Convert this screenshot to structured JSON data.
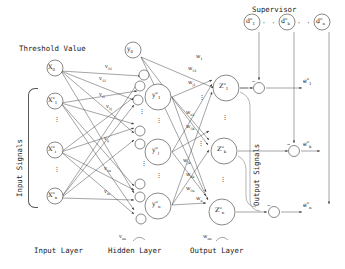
{
  "figure": {
    "stroke_color": "#3a3a3a",
    "text_color": "#1a1a1a",
    "background": "#ffffff"
  },
  "annotations": {
    "threshold_value": "Threshold Value",
    "supervisor": "Supervisor",
    "input_signals": "Input Signals",
    "output_signals": "Output Signals",
    "input_layer": "Input Layer",
    "hidden_layer": "Hidden Layer",
    "output_layer": "Output Layer",
    "ellipsis_h": "· · ·",
    "ellipsis_v": "⋮"
  },
  "layers": {
    "input": {
      "threshold_node": {
        "base": "X",
        "sub": "0",
        "sup": ""
      },
      "nodes": [
        {
          "base": "X",
          "sub": "1",
          "sup": "o"
        },
        {
          "base": "X",
          "sub": "i",
          "sup": "o"
        },
        {
          "base": "X",
          "sub": "n",
          "sup": "o"
        }
      ]
    },
    "hidden": {
      "threshold_node": {
        "base": "y",
        "sub": "0",
        "sup": ""
      },
      "nodes": [
        {
          "base": "y",
          "sub": "1",
          "sup": "o"
        },
        {
          "base": "y",
          "sub": "j",
          "sup": "o"
        },
        {
          "base": "y",
          "sub": "n",
          "sup": "o"
        }
      ]
    },
    "output": {
      "nodes": [
        {
          "base": "Z",
          "sub": "1",
          "sup": "o"
        },
        {
          "base": "Z",
          "sub": "k",
          "sup": "o"
        },
        {
          "base": "Z",
          "sub": "n",
          "sup": "o"
        }
      ]
    },
    "supervisor": {
      "nodes": [
        {
          "base": "d",
          "sub": "1",
          "sup": "o"
        },
        {
          "base": "d",
          "sub": "k",
          "sup": "o"
        },
        {
          "base": "d",
          "sub": "n",
          "sup": "o"
        }
      ]
    },
    "errors": [
      {
        "base": "e",
        "sub": "1",
        "sup": "o"
      },
      {
        "base": "e",
        "sub": "k",
        "sup": "o"
      },
      {
        "base": "e",
        "sub": "n",
        "sup": "o"
      }
    ]
  },
  "weights": {
    "input_to_hidden": [
      {
        "base": "v",
        "sub": "01"
      },
      {
        "base": "v",
        "sub": "11"
      },
      {
        "base": "v",
        "sub": "i1"
      },
      {
        "base": "v",
        "sub": "0j"
      },
      {
        "base": "v",
        "sub": "ij"
      },
      {
        "base": "v",
        "sub": "0n"
      },
      {
        "base": "v",
        "sub": "in"
      },
      {
        "base": "v",
        "sub": "nn"
      }
    ],
    "hidden_to_output": [
      {
        "base": "w",
        "sub": "1"
      },
      {
        "base": "w",
        "sub": "01"
      },
      {
        "base": "w",
        "sub": "j1"
      },
      {
        "base": "w",
        "sub": "n1"
      },
      {
        "base": "w",
        "sub": "0k"
      },
      {
        "base": "w",
        "sub": "jk"
      },
      {
        "base": "w",
        "sub": "nk"
      },
      {
        "base": "w",
        "sub": "0n"
      },
      {
        "base": "w",
        "sub": "n"
      },
      {
        "base": "w",
        "sub": "nn"
      }
    ]
  },
  "junction_sign": "−"
}
